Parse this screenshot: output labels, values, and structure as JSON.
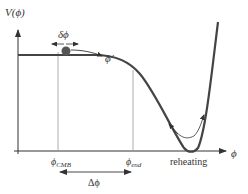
{
  "diagram": {
    "y_axis_label": "V(ϕ)",
    "x_axis_label": "ϕ",
    "labels": {
      "delta_phi": "δϕ",
      "phi_dot": "ϕ̇",
      "phi_cmb_base": "ϕ",
      "phi_cmb_sub": "CMB",
      "phi_end_base": "ϕ",
      "phi_end_sub": "end",
      "delta_big_phi": "Δϕ",
      "reheating": "reheating"
    },
    "colors": {
      "curve": "#444444",
      "axis": "#333333",
      "guide": "#9a9a9a",
      "ball": "#555555",
      "text": "#333333"
    }
  }
}
